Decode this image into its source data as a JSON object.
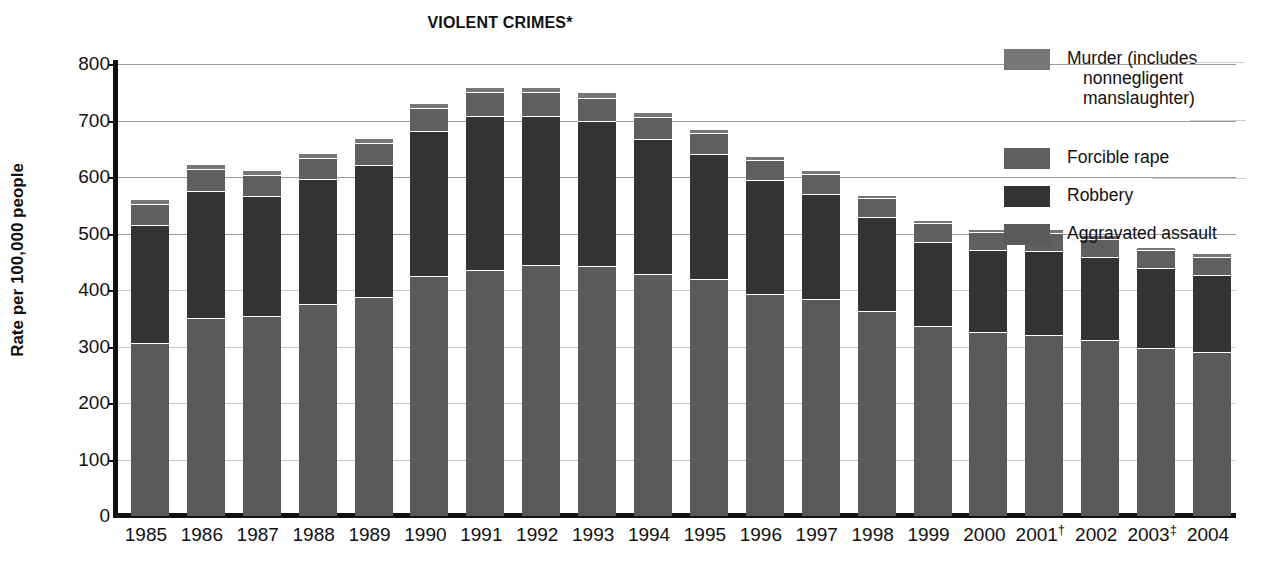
{
  "chart_data": {
    "type": "bar",
    "subtype": "stacked-bar",
    "title": "VIOLENT CRIMES*",
    "xlabel": "",
    "ylabel": "Rate per 100,000 people",
    "ylim": [
      0,
      800
    ],
    "ytick_step": 100,
    "yticks": [
      0,
      100,
      200,
      300,
      400,
      500,
      600,
      700,
      800
    ],
    "grid": true,
    "legend_position": "right",
    "categories": [
      "1985",
      "1986",
      "1987",
      "1988",
      "1989",
      "1990",
      "1991",
      "1992",
      "1993",
      "1994",
      "1995",
      "1996",
      "1997",
      "1998",
      "1999",
      "2000",
      "2001†",
      "2002",
      "2003‡",
      "2004"
    ],
    "series": [
      {
        "name": "Aggravated assault",
        "color": "#5a5a5a",
        "values": [
          305,
          348,
          352,
          373,
          386,
          423,
          433,
          442,
          441,
          427,
          418,
          391,
          382,
          361,
          334,
          324,
          319,
          310,
          295,
          288
        ]
      },
      {
        "name": "Robbery",
        "color": "#333333",
        "values": [
          209,
          226,
          213,
          221,
          234,
          257,
          273,
          264,
          256,
          238,
          221,
          202,
          186,
          166,
          150,
          145,
          149,
          146,
          142,
          137
        ]
      },
      {
        "name": "Forcible rape",
        "color": "#5f5f5f",
        "values": [
          37,
          38,
          37,
          38,
          38,
          41,
          42,
          43,
          41,
          39,
          37,
          36,
          36,
          34,
          33,
          32,
          32,
          33,
          32,
          32
        ]
      },
      {
        "name": "Murder (includes nonnegligent manslaughter)",
        "color": "#777777",
        "values": [
          8,
          9,
          8,
          8,
          9,
          9,
          10,
          9,
          10,
          9,
          8,
          7,
          7,
          6,
          6,
          6,
          6,
          6,
          6,
          6
        ]
      }
    ],
    "totals": [
      559,
      621,
      610,
      640,
      667,
      730,
      758,
      758,
      748,
      713,
      684,
      636,
      611,
      567,
      523,
      507,
      506,
      495,
      475,
      463
    ]
  },
  "legend": {
    "entries": [
      {
        "label_line1": "Murder (includes",
        "label_line2": "nonnegligent",
        "label_line3": "manslaughter)",
        "color": "#777777"
      },
      {
        "label_line1": "Forcible rape",
        "label_line2": "",
        "label_line3": "",
        "color": "#5f5f5f"
      },
      {
        "label_line1": "Robbery",
        "label_line2": "",
        "label_line3": "",
        "color": "#333333"
      },
      {
        "label_line1": "Aggravated assault",
        "label_line2": "",
        "label_line3": "",
        "color": "#5a5a5a"
      }
    ]
  }
}
